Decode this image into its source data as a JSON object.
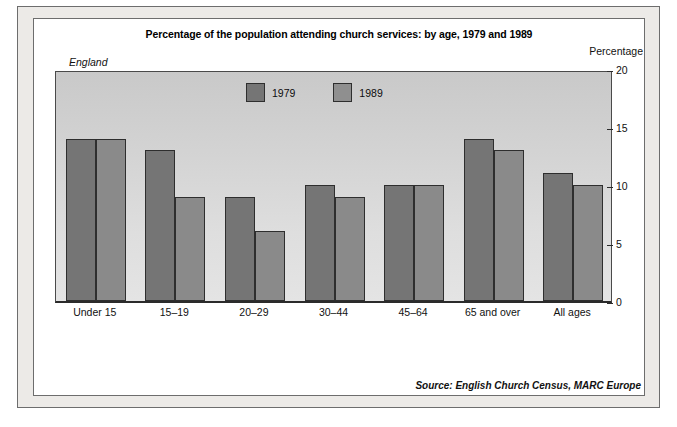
{
  "figure": {
    "title": "Percentage of the population attending church services: by age, 1979 and 1989",
    "region": "England",
    "axis_unit": "Percentage",
    "source": "Source: English Church Census, MARC Europe"
  },
  "legend": {
    "position": "top-center-inside",
    "items": [
      {
        "label": "1979",
        "color": "#757575"
      },
      {
        "label": "1989",
        "color": "#8f8f8f"
      }
    ]
  },
  "chart_data": {
    "type": "bar",
    "title": "Percentage of the population attending church services: by age, 1979 and 1989",
    "subtitle": "England",
    "xlabel": "",
    "ylabel": "Percentage",
    "ylim": [
      0,
      20
    ],
    "yticks": [
      0,
      5,
      10,
      15,
      20
    ],
    "grid": false,
    "axis_position": "right",
    "categories": [
      "Under 15",
      "15–19",
      "20–29",
      "30–44",
      "45–64",
      "65 and over",
      "All ages"
    ],
    "series": [
      {
        "name": "1979",
        "color": "#757575",
        "values": [
          14,
          13,
          9,
          10,
          10,
          14,
          11
        ]
      },
      {
        "name": "1989",
        "color": "#8a8a8a",
        "values": [
          14,
          9,
          6,
          9,
          10,
          13,
          10
        ]
      }
    ],
    "annotations": [
      "Source: English Church Census, MARC Europe"
    ]
  }
}
